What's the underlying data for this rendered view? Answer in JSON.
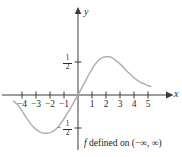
{
  "figure": {
    "caption_function": "f",
    "caption_text": " defined on (−∞, ∞)",
    "curve_color": "#b2b0b0",
    "axis_color": "#3a3a3a"
  },
  "axes": {
    "x_name": "x",
    "y_name": "y",
    "x_ticks": [
      {
        "label": "−4",
        "value": -4
      },
      {
        "label": "−3",
        "value": -3
      },
      {
        "label": "−2",
        "value": -2
      },
      {
        "label": "−1",
        "value": -1
      },
      {
        "label": "1",
        "value": 1
      },
      {
        "label": "2",
        "value": 2
      },
      {
        "label": "3",
        "value": 3
      },
      {
        "label": "4",
        "value": 4
      },
      {
        "label": "5",
        "value": 5
      }
    ],
    "y_ticks": [
      {
        "label": "1/2",
        "numerator": "1",
        "denominator": "2",
        "value": 0.5,
        "sign": ""
      },
      {
        "label": "−1/2",
        "numerator": "1",
        "denominator": "2",
        "value": -0.5,
        "sign": "−"
      }
    ]
  },
  "chart_data": {
    "type": "line",
    "title": "",
    "subtitle": "",
    "xlabel": "x",
    "ylabel": "y",
    "xlim": [
      -4.8,
      5.6
    ],
    "ylim": [
      -0.82,
      0.95
    ],
    "grid": false,
    "legend": null,
    "annotations": [
      {
        "text": "f defined on (−∞, ∞)",
        "position": "below-axis-right"
      }
    ],
    "series": [
      {
        "name": "f",
        "color": "#b2b0b0",
        "x": [
          -4.6,
          -4.4,
          -4.2,
          -4.0,
          -3.8,
          -3.6,
          -3.4,
          -3.2,
          -3.0,
          -2.8,
          -2.6,
          -2.4,
          -2.2,
          -2.0,
          -1.8,
          -1.6,
          -1.4,
          -1.2,
          -1.0,
          -0.8,
          -0.6,
          -0.4,
          -0.2,
          0.0,
          0.2,
          0.4,
          0.6,
          0.8,
          1.0,
          1.2,
          1.4,
          1.6,
          1.8,
          2.0,
          2.2,
          2.4,
          2.6,
          2.8,
          3.0,
          3.2,
          3.4,
          3.6,
          3.8,
          4.0,
          4.2,
          4.4,
          4.6,
          4.8,
          5.0,
          5.2
        ],
        "y": [
          -0.09,
          -0.13,
          -0.18,
          -0.24,
          -0.31,
          -0.37,
          -0.43,
          -0.48,
          -0.52,
          -0.55,
          -0.57,
          -0.58,
          -0.58,
          -0.57,
          -0.55,
          -0.52,
          -0.48,
          -0.42,
          -0.36,
          -0.29,
          -0.22,
          -0.15,
          -0.07,
          0.0,
          0.08,
          0.16,
          0.24,
          0.32,
          0.39,
          0.46,
          0.51,
          0.55,
          0.57,
          0.58,
          0.58,
          0.57,
          0.54,
          0.51,
          0.47,
          0.43,
          0.38,
          0.34,
          0.3,
          0.26,
          0.23,
          0.2,
          0.18,
          0.16,
          0.14,
          0.13
        ]
      }
    ],
    "key_points": [
      {
        "name": "origin",
        "x": 0,
        "y": 0
      },
      {
        "name": "minimum",
        "x": -2.1,
        "y": -0.58
      },
      {
        "name": "maximum",
        "x": 2.1,
        "y": 0.58
      }
    ]
  }
}
